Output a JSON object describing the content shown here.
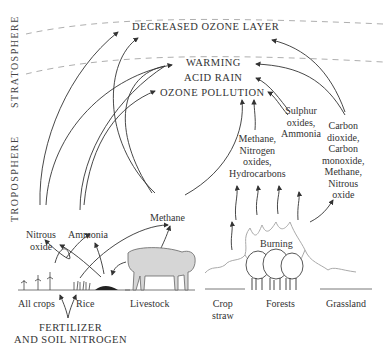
{
  "zones": {
    "stratosphere": "STRATOSPHERE",
    "troposphere": "TROPOSPHERE"
  },
  "effects": {
    "decreased_ozone": "DECREASED OZONE LAYER",
    "warming": "WARMING",
    "acid_rain": "ACID RAIN",
    "ozone_pollution": "OZONE POLLUTION"
  },
  "gases": {
    "nitrous_oxide": [
      "Nitrous",
      "oxide"
    ],
    "ammonia": "Ammonia",
    "methane": "Methane",
    "methane_nox_hc": [
      "Methane,",
      "Nitrogen",
      "oxides,",
      "Hydrocarbons"
    ],
    "sulphur": [
      "Sulphur",
      "oxides,",
      "Ammonia"
    ],
    "carbon": [
      "Carbon",
      "dioxide,",
      "Carbon",
      "monoxide,",
      "Methane,",
      "Nitrous",
      "oxide"
    ]
  },
  "sources": {
    "all_crops": "All crops",
    "rice": "Rice",
    "livestock": "Livestock",
    "crop_straw": [
      "Crop",
      "straw"
    ],
    "forests": "Forests",
    "grassland": "Grassland",
    "burning": "Burning"
  },
  "inputs": {
    "fertilizer": [
      "FERTILIZER",
      "AND SOIL NITROGEN"
    ]
  }
}
